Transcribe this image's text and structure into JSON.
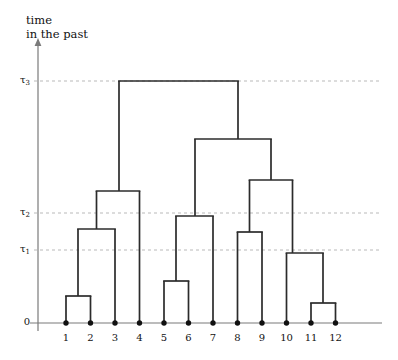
{
  "figure": {
    "type": "dendrogram-coalescent-tree",
    "background_color": "#ffffff",
    "line_color": "#2b2b2b",
    "axis_color": "#7a7a7a",
    "grid_color": "#b9b9b9",
    "node_color": "#111111"
  },
  "axis": {
    "title_line1": "time",
    "title_line2": "in the past",
    "arrow": "up-arrow-icon",
    "origin_label": "0",
    "ticks": [
      {
        "label": "τ",
        "sub": "1",
        "value_px_y": 250
      },
      {
        "label": "τ",
        "sub": "2",
        "value_px_y": 213
      },
      {
        "label": "τ",
        "sub": "3",
        "value_px_y": 81
      }
    ]
  },
  "leaves": [
    {
      "label": "1",
      "x": 66
    },
    {
      "label": "2",
      "x": 90.5
    },
    {
      "label": "3",
      "x": 115
    },
    {
      "label": "4",
      "x": 139.5
    },
    {
      "label": "5",
      "x": 164
    },
    {
      "label": "6",
      "x": 188.5
    },
    {
      "label": "7",
      "x": 213
    },
    {
      "label": "8",
      "x": 237.5
    },
    {
      "label": "9",
      "x": 262
    },
    {
      "label": "10",
      "x": 286.5
    },
    {
      "label": "11",
      "x": 311
    },
    {
      "label": "12",
      "x": 335.5
    }
  ],
  "chart_data": {
    "type": "line",
    "title": "",
    "xlabel": "",
    "ylabel": "time in the past",
    "grid": true,
    "legend_position": "none",
    "baseline_y": 323,
    "axis_x": 38,
    "axis_top_y": 44,
    "axis_right_x": 382,
    "tick_levels": {
      "tau1": 250,
      "tau2": 213,
      "tau3": 81
    },
    "coalescent_nodes": [
      {
        "name": "n12",
        "children": [
          "1",
          "2"
        ],
        "y": 296,
        "left_x": 66,
        "right_x": 90.5,
        "stem_x": 78
      },
      {
        "name": "n123",
        "children": [
          "n12",
          "3"
        ],
        "y": 229,
        "left_x": 78,
        "right_x": 115,
        "stem_x": 96.5
      },
      {
        "name": "n1234",
        "children": [
          "n123",
          "4"
        ],
        "y": 191,
        "left_x": 96.5,
        "right_x": 139.5,
        "stem_x": 119
      },
      {
        "name": "n56",
        "children": [
          "5",
          "6"
        ],
        "y": 281,
        "left_x": 164,
        "right_x": 188.5,
        "stem_x": 176
      },
      {
        "name": "n567",
        "children": [
          "n56",
          "7"
        ],
        "y": 216,
        "left_x": 176,
        "right_x": 213,
        "stem_x": 195
      },
      {
        "name": "n89",
        "children": [
          "8",
          "9"
        ],
        "y": 232,
        "left_x": 237.5,
        "right_x": 262,
        "stem_x": 249.5
      },
      {
        "name": "n1112",
        "children": [
          "11",
          "12"
        ],
        "y": 303,
        "left_x": 311,
        "right_x": 335.5,
        "stem_x": 323
      },
      {
        "name": "n101112",
        "children": [
          "10",
          "n1112"
        ],
        "y": 253,
        "left_x": 286.5,
        "right_x": 323,
        "stem_x": 292.5
      },
      {
        "name": "n89_101112",
        "children": [
          "n89",
          "n101112"
        ],
        "y": 180,
        "left_x": 249.5,
        "right_x": 292.5,
        "stem_x": 271
      },
      {
        "name": "n567_right",
        "children": [
          "n567",
          "n89_101112"
        ],
        "y": 139,
        "left_x": 195,
        "right_x": 271,
        "stem_x": 238
      },
      {
        "name": "root",
        "children": [
          "n1234",
          "n567_right"
        ],
        "y": 81,
        "left_x": 119,
        "right_x": 238,
        "stem_x": 178
      }
    ]
  }
}
